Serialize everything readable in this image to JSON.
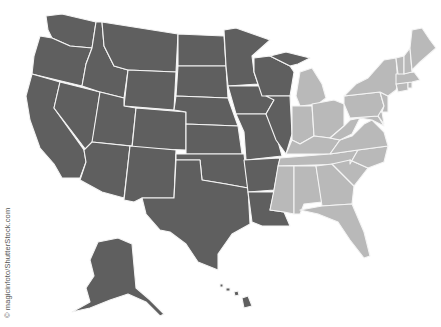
{
  "map": {
    "title": "United States map divided into two regions",
    "colors": {
      "west": "#5f5f5f",
      "east": "#b9b9b9",
      "border": "#f4f4f4",
      "background": "#ffffff"
    },
    "regions": [
      {
        "name": "west",
        "states": [
          "WA",
          "OR",
          "CA",
          "ID",
          "NV",
          "MT",
          "WY",
          "UT",
          "AZ",
          "CO",
          "NM",
          "ND",
          "SD",
          "NE",
          "KS",
          "OK",
          "TX",
          "MN",
          "IA",
          "MO",
          "AR",
          "LA",
          "WI",
          "IL",
          "MI-UP",
          "AK",
          "HI"
        ]
      },
      {
        "name": "east",
        "states": [
          "MI",
          "IN",
          "OH",
          "KY",
          "TN",
          "MS",
          "AL",
          "GA",
          "FL",
          "SC",
          "NC",
          "VA",
          "WV",
          "MD",
          "DE",
          "PA",
          "NJ",
          "NY",
          "CT",
          "RI",
          "MA",
          "VT",
          "NH",
          "ME"
        ]
      }
    ]
  },
  "credit": {
    "text": "© magicinfoto/ShutterStock.com"
  }
}
